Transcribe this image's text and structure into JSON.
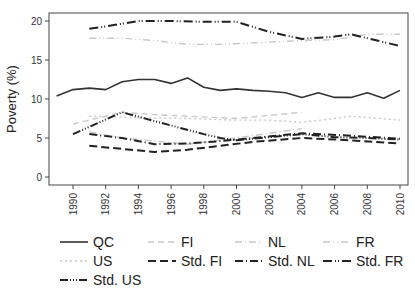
{
  "chart_data": {
    "type": "line",
    "title": "",
    "xlabel": "",
    "ylabel": "Poverty (%)",
    "ylim": [
      0,
      20
    ],
    "yticks": [
      0,
      5,
      10,
      15,
      20
    ],
    "xticks": [
      1990,
      1992,
      1994,
      1996,
      1998,
      2000,
      2002,
      2004,
      2006,
      2008,
      2010
    ],
    "grid": false,
    "legend_position": "bottom",
    "series": [
      {
        "name": "QC",
        "color": "#333333",
        "width": 1.6,
        "dash": "",
        "points": [
          [
            1989,
            10.4
          ],
          [
            1990,
            11.2
          ],
          [
            1991,
            11.4
          ],
          [
            1992,
            11.2
          ],
          [
            1993,
            12.2
          ],
          [
            1994,
            12.5
          ],
          [
            1995,
            12.5
          ],
          [
            1996,
            12.0
          ],
          [
            1997,
            12.7
          ],
          [
            1998,
            11.5
          ],
          [
            1999,
            11.1
          ],
          [
            2000,
            11.3
          ],
          [
            2001,
            11.1
          ],
          [
            2002,
            11.0
          ],
          [
            2003,
            10.8
          ],
          [
            2004,
            10.2
          ],
          [
            2005,
            10.8
          ],
          [
            2006,
            10.2
          ],
          [
            2007,
            10.2
          ],
          [
            2008,
            10.8
          ],
          [
            2009,
            10.1
          ],
          [
            2010,
            11.1
          ]
        ]
      },
      {
        "name": "FI",
        "color": "#c8c8c8",
        "width": 1.4,
        "dash": "6,4",
        "points": [
          [
            1990,
            6.8
          ],
          [
            1991,
            7.3
          ],
          [
            1992,
            7.8
          ],
          [
            1993,
            8.3
          ],
          [
            1995,
            8.0
          ],
          [
            1997,
            7.8
          ],
          [
            2000,
            7.5
          ],
          [
            2002,
            7.9
          ],
          [
            2004,
            8.3
          ]
        ]
      },
      {
        "name": "NL",
        "color": "#c8c8c8",
        "width": 1.4,
        "dash": "7,3,1,3",
        "points": [
          [
            1991,
            5.8
          ],
          [
            1993,
            5.0
          ],
          [
            1995,
            4.6
          ],
          [
            1997,
            4.2
          ],
          [
            2000,
            5.0
          ],
          [
            2002,
            5.6
          ],
          [
            2004,
            6.2
          ]
        ]
      },
      {
        "name": "FR",
        "color": "#c8c8c8",
        "width": 1.4,
        "dash": "7,3,1,3,1,3",
        "points": [
          [
            1991,
            17.8
          ],
          [
            1993,
            17.8
          ],
          [
            1995,
            17.5
          ],
          [
            1997,
            17.0
          ],
          [
            1999,
            17.0
          ],
          [
            2002,
            17.3
          ],
          [
            2004,
            17.5
          ],
          [
            2006,
            17.6
          ],
          [
            2008,
            18.3
          ],
          [
            2010,
            18.3
          ]
        ]
      },
      {
        "name": "US",
        "color": "#c8c8c8",
        "width": 1.4,
        "dash": "2,3",
        "points": [
          [
            1991,
            7.8
          ],
          [
            1994,
            7.6
          ],
          [
            1997,
            7.5
          ],
          [
            2000,
            7.3
          ],
          [
            2002,
            7.3
          ],
          [
            2004,
            7.0
          ],
          [
            2006,
            7.5
          ],
          [
            2007,
            7.8
          ],
          [
            2010,
            7.3
          ]
        ]
      },
      {
        "name": "Std. FI",
        "color": "#222222",
        "width": 2.0,
        "dash": "8,4",
        "points": [
          [
            1991,
            4.0
          ],
          [
            1993,
            3.6
          ],
          [
            1995,
            3.2
          ],
          [
            1997,
            3.5
          ],
          [
            1999,
            4.0
          ],
          [
            2001,
            4.5
          ],
          [
            2004,
            5.0
          ],
          [
            2007,
            4.7
          ],
          [
            2010,
            4.3
          ]
        ]
      },
      {
        "name": "Std. NL",
        "color": "#222222",
        "width": 2.0,
        "dash": "8,3,1,3",
        "points": [
          [
            1991,
            5.5
          ],
          [
            1993,
            5.0
          ],
          [
            1995,
            4.2
          ],
          [
            1997,
            4.3
          ],
          [
            1999,
            4.6
          ],
          [
            2001,
            5.0
          ],
          [
            2004,
            5.6
          ],
          [
            2007,
            5.3
          ],
          [
            2010,
            4.9
          ]
        ]
      },
      {
        "name": "Std. FR",
        "color": "#222222",
        "width": 2.0,
        "dash": "9,3,1,2,1,3",
        "points": [
          [
            1991,
            19.0
          ],
          [
            1992,
            19.3
          ],
          [
            1994,
            20.0
          ],
          [
            1996,
            20.0
          ],
          [
            1998,
            19.9
          ],
          [
            2000,
            19.9
          ],
          [
            2002,
            18.6
          ],
          [
            2004,
            17.7
          ],
          [
            2006,
            18.0
          ],
          [
            2007,
            18.3
          ],
          [
            2010,
            16.8
          ]
        ]
      },
      {
        "name": "Std. US",
        "color": "#222222",
        "width": 2.0,
        "dash": "8,2,1,2,1,2,1,2",
        "points": [
          [
            1990,
            5.5
          ],
          [
            1993,
            8.3
          ],
          [
            1996,
            6.6
          ],
          [
            1998,
            5.5
          ],
          [
            1999,
            5.0
          ],
          [
            2000,
            4.7
          ],
          [
            2002,
            5.1
          ],
          [
            2004,
            5.5
          ],
          [
            2006,
            5.1
          ],
          [
            2008,
            5.0
          ],
          [
            2010,
            4.8
          ]
        ]
      }
    ]
  },
  "legend": {
    "items": [
      "QC",
      "FI",
      "NL",
      "FR",
      "US",
      "Std. FI",
      "Std. NL",
      "Std. FR",
      "Std. US"
    ]
  }
}
